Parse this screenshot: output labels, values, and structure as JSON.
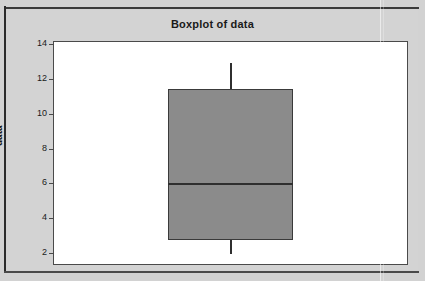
{
  "window": {
    "background_color": "#d2d2d2"
  },
  "chart": {
    "title": "Boxplot of data",
    "y_axis_label": "data",
    "plot_background_color": "#ffffff",
    "box_fill_color": "#8b8b8b",
    "line_color": "#2f2f2f"
  },
  "chart_data": {
    "type": "box",
    "title": "Boxplot of data",
    "xlabel": "",
    "ylabel": "data",
    "ylim": [
      1.4,
      14.2
    ],
    "y_ticks": [
      2,
      4,
      6,
      8,
      10,
      12,
      14
    ],
    "y_tick_labels": [
      "2",
      "4",
      "6",
      "8",
      "10",
      "12",
      "14"
    ],
    "grid": false,
    "legend": false,
    "categories": [
      "data"
    ],
    "boxes": [
      {
        "name": "data",
        "whisker_low": 2.0,
        "q1": 2.8,
        "median": 6.0,
        "q3": 11.5,
        "whisker_high": 13.0,
        "outliers": [],
        "fill": "#8b8b8b"
      }
    ]
  }
}
